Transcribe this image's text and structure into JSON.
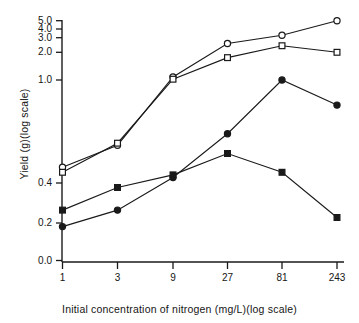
{
  "chart_data": {
    "type": "line",
    "title": "",
    "xlabel": "Initial concentration of nitrogen (mg/L)(log scale)",
    "ylabel": "Yield (g)(log scale)",
    "x_scale": "log",
    "y_scale": "log",
    "grid": false,
    "legend": "none",
    "x": [
      1,
      3,
      9,
      27,
      81,
      243
    ],
    "xtick_labels": [
      "1",
      "3",
      "9",
      "27",
      "81",
      "243"
    ],
    "ytick_labels": [
      "0.0",
      "0.2",
      "0.4",
      "1.0",
      "2.0",
      "3.0",
      "4.0",
      "5.0"
    ],
    "ytick_values": [
      0.0,
      0.2,
      0.4,
      1.0,
      2.0,
      3.0,
      4.0,
      5.0
    ],
    "ylim": [
      0.0,
      5.0
    ],
    "series": [
      {
        "name": "open-circle",
        "marker": "open-circle",
        "values": [
          0.46,
          0.56,
          1.08,
          2.55,
          3.25,
          5.0
        ]
      },
      {
        "name": "open-square",
        "marker": "open-square",
        "values": [
          0.44,
          0.57,
          1.02,
          1.75,
          2.4,
          2.0
        ]
      },
      {
        "name": "filled-circle",
        "marker": "filled-circle",
        "values": [
          0.15,
          0.25,
          0.42,
          0.62,
          1.0,
          0.8
        ]
      },
      {
        "name": "filled-square",
        "marker": "filled-square",
        "values": [
          0.25,
          0.37,
          0.43,
          0.52,
          0.44,
          0.22
        ]
      }
    ]
  },
  "axis_color": "#1a1a1a",
  "line_color": "#1a1a1a"
}
